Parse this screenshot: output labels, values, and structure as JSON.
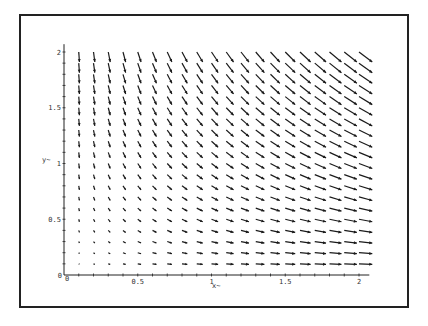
{
  "chart_data": {
    "type": "vector_field",
    "title": "",
    "xlabel": "x~",
    "ylabel": "y~",
    "xlim": [
      0,
      2.05
    ],
    "ylim": [
      0,
      2.05
    ],
    "x_ticks": [
      {
        "v": 0,
        "label": "0"
      },
      {
        "v": 0.5,
        "label": "0.5"
      },
      {
        "v": 1,
        "label": "1"
      },
      {
        "v": 1.5,
        "label": "1.5"
      },
      {
        "v": 2,
        "label": "2"
      }
    ],
    "y_ticks": [
      {
        "v": 0,
        "label": "0"
      },
      {
        "v": 0.5,
        "label": "0.5"
      },
      {
        "v": 1,
        "label": "1"
      },
      {
        "v": 1.5,
        "label": "1.5"
      },
      {
        "v": 2,
        "label": "2"
      }
    ],
    "grid": false,
    "field": {
      "u": "x",
      "v": "-y",
      "x_start": 0.1,
      "x_step": 0.1,
      "x_count": 20,
      "y_start": 0.1,
      "y_step": 0.1,
      "y_count": 20
    },
    "arrow_color": "#1a1a1a"
  },
  "axis_labels": {
    "x": "x~",
    "y": "y~",
    "origin": "0"
  }
}
